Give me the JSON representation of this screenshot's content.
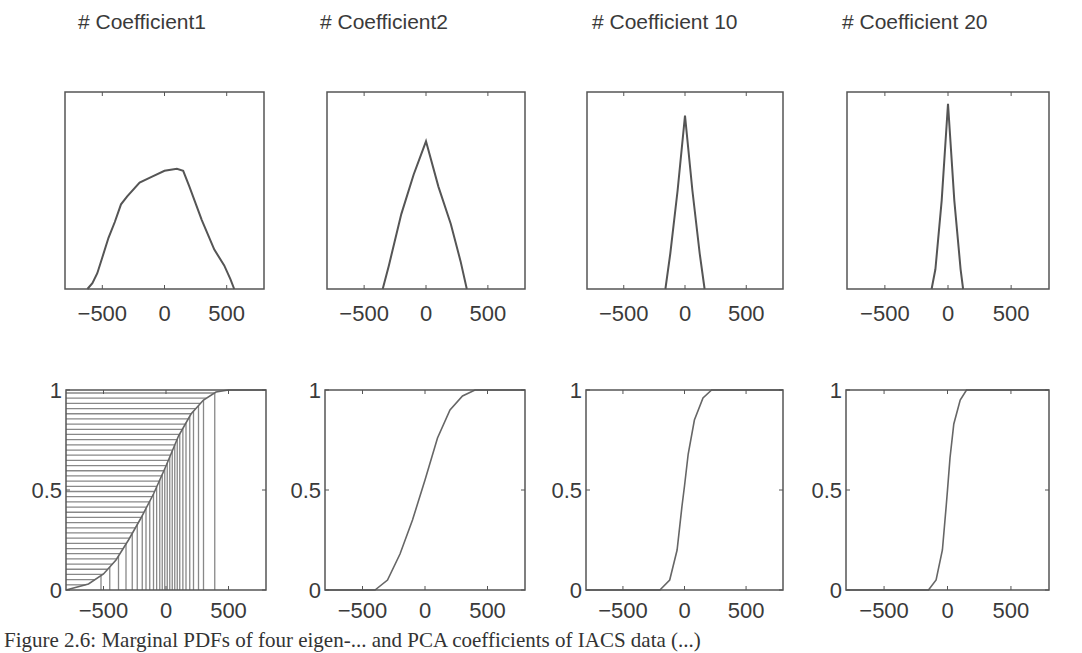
{
  "figure": {
    "caption": "Figure 2.6: Marginal PDFs of four eigen-... and PCA coefficients of IACS data (...)"
  },
  "chart_data": [
    {
      "type": "line",
      "title": "# Coefficient1",
      "row": "pdf",
      "xlabel": "",
      "ylabel": "",
      "xlim": [
        -800,
        800
      ],
      "xticks": [
        -500,
        0,
        500
      ],
      "yticks": [],
      "support": [
        -620,
        560
      ],
      "peak_x": 100,
      "peak_rel_height": 0.61,
      "grid": false,
      "points": [
        [
          -620,
          0
        ],
        [
          -580,
          0.03
        ],
        [
          -540,
          0.08
        ],
        [
          -500,
          0.16
        ],
        [
          -450,
          0.26
        ],
        [
          -400,
          0.34
        ],
        [
          -350,
          0.43
        ],
        [
          -300,
          0.47
        ],
        [
          -200,
          0.54
        ],
        [
          -100,
          0.57
        ],
        [
          0,
          0.6
        ],
        [
          100,
          0.61
        ],
        [
          150,
          0.6
        ],
        [
          200,
          0.52
        ],
        [
          300,
          0.35
        ],
        [
          400,
          0.2
        ],
        [
          480,
          0.12
        ],
        [
          530,
          0.05
        ],
        [
          560,
          0
        ]
      ]
    },
    {
      "type": "line",
      "title": "# Coefficient2",
      "row": "pdf",
      "xlabel": "",
      "ylabel": "",
      "xlim": [
        -800,
        800
      ],
      "xticks": [
        -500,
        0,
        500
      ],
      "yticks": [],
      "support": [
        -350,
        330
      ],
      "peak_x": 0,
      "peak_rel_height": 0.75,
      "grid": false,
      "points": [
        [
          -350,
          0
        ],
        [
          -300,
          0.12
        ],
        [
          -200,
          0.38
        ],
        [
          -100,
          0.58
        ],
        [
          0,
          0.75
        ],
        [
          100,
          0.52
        ],
        [
          200,
          0.33
        ],
        [
          280,
          0.14
        ],
        [
          330,
          0
        ]
      ]
    },
    {
      "type": "line",
      "title": "# Coefficient 10",
      "row": "pdf",
      "xlabel": "",
      "ylabel": "",
      "xlim": [
        -800,
        800
      ],
      "xticks": [
        -500,
        0,
        500
      ],
      "yticks": [],
      "support": [
        -160,
        160
      ],
      "peak_x": 0,
      "peak_rel_height": 0.88,
      "grid": false,
      "points": [
        [
          -160,
          0
        ],
        [
          -120,
          0.18
        ],
        [
          -60,
          0.5
        ],
        [
          0,
          0.88
        ],
        [
          60,
          0.5
        ],
        [
          120,
          0.18
        ],
        [
          160,
          0
        ]
      ]
    },
    {
      "type": "line",
      "title": "# Coefficient 20",
      "row": "pdf",
      "xlabel": "",
      "ylabel": "",
      "xlim": [
        -800,
        800
      ],
      "xticks": [
        -500,
        0,
        500
      ],
      "yticks": [],
      "support": [
        -130,
        120
      ],
      "peak_x": 0,
      "peak_rel_height": 0.94,
      "grid": false,
      "points": [
        [
          -130,
          0
        ],
        [
          -100,
          0.1
        ],
        [
          -50,
          0.45
        ],
        [
          0,
          0.94
        ],
        [
          50,
          0.45
        ],
        [
          100,
          0.1
        ],
        [
          120,
          0
        ]
      ]
    },
    {
      "type": "line",
      "title": "CDF Coefficient1",
      "row": "cdf",
      "xlim": [
        -800,
        800
      ],
      "ylim": [
        0,
        1
      ],
      "xticks": [
        -500,
        0,
        500
      ],
      "yticks": [
        0,
        0.5,
        1
      ],
      "hatched": true,
      "points": [
        [
          -800,
          0
        ],
        [
          -620,
          0.03
        ],
        [
          -500,
          0.08
        ],
        [
          -400,
          0.15
        ],
        [
          -300,
          0.25
        ],
        [
          -200,
          0.36
        ],
        [
          -100,
          0.48
        ],
        [
          0,
          0.62
        ],
        [
          100,
          0.77
        ],
        [
          200,
          0.88
        ],
        [
          300,
          0.95
        ],
        [
          400,
          0.99
        ],
        [
          500,
          1
        ],
        [
          800,
          1
        ]
      ]
    },
    {
      "type": "line",
      "title": "CDF Coefficient2",
      "row": "cdf",
      "xlim": [
        -800,
        800
      ],
      "ylim": [
        0,
        1
      ],
      "xticks": [
        -500,
        0,
        500
      ],
      "yticks": [
        0,
        0.5,
        1
      ],
      "points": [
        [
          -800,
          0
        ],
        [
          -400,
          0
        ],
        [
          -300,
          0.05
        ],
        [
          -200,
          0.18
        ],
        [
          -100,
          0.35
        ],
        [
          0,
          0.55
        ],
        [
          100,
          0.76
        ],
        [
          200,
          0.9
        ],
        [
          300,
          0.97
        ],
        [
          400,
          1
        ],
        [
          500,
          1
        ],
        [
          800,
          1
        ]
      ]
    },
    {
      "type": "line",
      "title": "CDF Coefficient10",
      "row": "cdf",
      "xlim": [
        -800,
        800
      ],
      "ylim": [
        0,
        1
      ],
      "xticks": [
        -500,
        0,
        500
      ],
      "yticks": [
        0,
        0.5,
        1
      ],
      "points": [
        [
          -800,
          0
        ],
        [
          -200,
          0
        ],
        [
          -120,
          0.05
        ],
        [
          -60,
          0.2
        ],
        [
          -20,
          0.42
        ],
        [
          0,
          0.52
        ],
        [
          30,
          0.68
        ],
        [
          80,
          0.85
        ],
        [
          150,
          0.96
        ],
        [
          220,
          1
        ],
        [
          800,
          1
        ]
      ]
    },
    {
      "type": "line",
      "title": "CDF Coefficient20",
      "row": "cdf",
      "xlim": [
        -800,
        800
      ],
      "ylim": [
        0,
        1
      ],
      "xticks": [
        -500,
        0,
        500
      ],
      "yticks": [
        0,
        0.5,
        1
      ],
      "points": [
        [
          -800,
          0
        ],
        [
          -150,
          0
        ],
        [
          -90,
          0.05
        ],
        [
          -40,
          0.2
        ],
        [
          -10,
          0.42
        ],
        [
          0,
          0.5
        ],
        [
          20,
          0.66
        ],
        [
          50,
          0.83
        ],
        [
          100,
          0.95
        ],
        [
          150,
          1
        ],
        [
          800,
          1
        ]
      ]
    }
  ],
  "panels": {
    "titles": [
      "# Coefficient1",
      "# Coefficient2",
      "# Coefficient 10",
      "# Coefficient 20"
    ],
    "xtick_labels": [
      "−500",
      "0",
      "500"
    ],
    "ytick_labels": [
      "0",
      "0.5",
      "1"
    ]
  },
  "colors": {
    "axis": "#555555",
    "line": "#666666",
    "text": "#3a3a3a"
  }
}
